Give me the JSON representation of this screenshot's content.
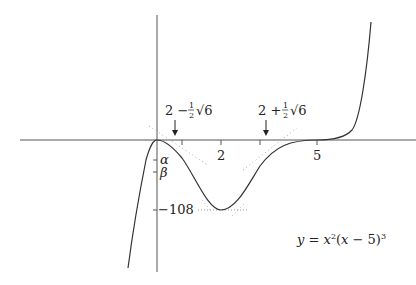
{
  "diagram": {
    "type": "function-graph",
    "equation": {
      "y": "y",
      "eq": " = ",
      "x1": "x",
      "sq": "2",
      "open": "(",
      "x2": "x",
      "minus5": " − 5)",
      "cube": "3"
    },
    "x_axis_ticks": [
      {
        "label": "2",
        "value": 2
      },
      {
        "label": "5",
        "value": 5
      }
    ],
    "y_axis_ticks": [
      {
        "label": "α",
        "value": "alpha"
      },
      {
        "label": "β",
        "value": "beta"
      },
      {
        "label": "−108",
        "value": -108
      }
    ],
    "inflection_labels": [
      {
        "lead": "2 − ",
        "num": "1",
        "den": "2",
        "root": "√6",
        "value": 0.775
      },
      {
        "lead": "2 + ",
        "num": "1",
        "den": "2",
        "root": "√6",
        "value": 3.225
      }
    ],
    "key_points": {
      "local_max": {
        "x": 0,
        "y": 0
      },
      "local_min": {
        "x": 2,
        "y": -108
      },
      "stationary_inflection": {
        "x": 5,
        "y": 0
      }
    },
    "colors": {
      "axis": "#555555",
      "curve": "#333333",
      "tangent_dots": "#9a9a9a",
      "text": "#222222"
    }
  }
}
